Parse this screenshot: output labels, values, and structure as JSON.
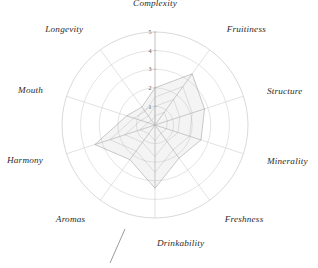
{
  "chart_data": {
    "type": "radar",
    "title": "",
    "subtitle": "",
    "xlabel": "",
    "ylabel": "",
    "grid": true,
    "legend_position": "none",
    "rmin": 0,
    "rmax": 5,
    "tick_labels": [
      "1",
      "2",
      "3",
      "4",
      "5"
    ],
    "tick_values": [
      1,
      2,
      3,
      4,
      5
    ],
    "tick_axis_angle_deg": 0,
    "categories": [
      "Complexity",
      "Fruitiness",
      "Structure",
      "Minerality",
      "Freshness",
      "Drinkability",
      "Aromas",
      "Harmony",
      "Mouth",
      "Longevity"
    ],
    "series": [
      {
        "name": "Tasting profile",
        "values": [
          2.0,
          3.4,
          2.8,
          2.6,
          2.2,
          3.4,
          2.3,
          3.4,
          1.6,
          1.2
        ],
        "fill_color": "#bcbcbc",
        "line_color": "#9a9a9a"
      }
    ],
    "annotations": [
      {
        "name": "drinkability-leader-line",
        "text": ""
      }
    ]
  },
  "colors": {
    "grid": "#d2d2d2",
    "spoke": "#cfcfcf",
    "label": "#2b2b2b",
    "tick": "#5a5a5a",
    "series_fill": "#bcbcbc",
    "series_stroke": "#9a9a9a",
    "background": "#ffffff"
  },
  "labels": {
    "complexity": "Complexity",
    "fruitiness": "Fruitiness",
    "structure": "Structure",
    "minerality": "Minerality",
    "freshness": "Freshness",
    "drinkability": "Drinkability",
    "aromas": "Aromas",
    "harmony": "Harmony",
    "mouth": "Mouth",
    "longevity": "Longevity"
  },
  "ticks": {
    "t1": "1",
    "t2": "2",
    "t3": "3",
    "t4": "4",
    "t5": "5"
  }
}
